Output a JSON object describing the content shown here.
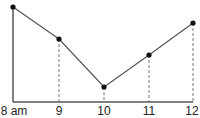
{
  "chart_data": {
    "type": "line",
    "title": "",
    "xlabel": "",
    "ylabel": "",
    "categories": [
      "8 am",
      "9",
      "10",
      "11",
      "12"
    ],
    "series": [
      {
        "name": "series",
        "values": [
          95,
          63,
          15,
          47,
          79
        ]
      }
    ],
    "ylim": [
      0,
      100
    ],
    "grid": false,
    "legend": "none",
    "annotations": "dashed vertical drop lines from each point to x-axis (except first, which sits on solid y-axis)",
    "colors": {
      "line": "#555555",
      "marker": "#111111",
      "axis": "#555555",
      "dash": "#777777"
    }
  },
  "axis": {
    "x_tick_labels": [
      "8 am",
      "9",
      "10",
      "11",
      "12"
    ]
  }
}
